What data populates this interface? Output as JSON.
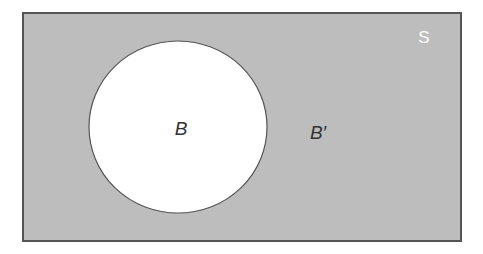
{
  "diagram": {
    "type": "venn",
    "universal_set": {
      "label": "S",
      "fill": "#bdbdbd",
      "stroke": "#555555",
      "label_color": "#ffffff"
    },
    "sets": [
      {
        "label": "B",
        "fill": "#ffffff",
        "stroke": "#555555",
        "label_color": "#333333"
      }
    ],
    "complement": {
      "label": "B′",
      "label_color": "#333333"
    }
  }
}
